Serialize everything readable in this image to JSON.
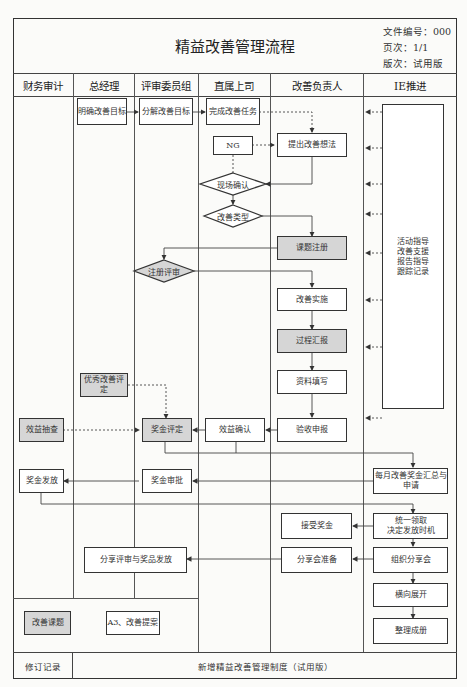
{
  "title": "精益改善管理流程",
  "meta": {
    "doc_no": "文件编号：000",
    "page": "页次：1/1",
    "version": "版次：试用版"
  },
  "columns": [
    "财务审计",
    "总经理",
    "评审委员组",
    "直属上司",
    "改善负责人",
    "IE推进"
  ],
  "nodes": {
    "define_goal": "明确改善目标",
    "decompose_goal": "分解改善目标",
    "complete_task": "完成改善任务",
    "ng": "NG",
    "propose_idea": "提出改善想法",
    "onsite_confirm": "现场确认",
    "improve_type": "改善类型",
    "topic_register": "课题注册",
    "register_review": "注册评审",
    "implement": "改善实施",
    "process_report": "过程汇报",
    "fill_data": "资料填写",
    "acceptance": "验收申报",
    "benefit_confirm": "效益确认",
    "bonus_assess": "奖金评定",
    "excellent_assess": "优秀改善评定",
    "benefit_audit": "效益抽查",
    "ie_support": [
      "活动指导",
      "改善支援",
      "报告指导",
      "跟踪记录"
    ],
    "monthly_summary": "每月改善奖金汇总与申请",
    "bonus_approve": "奖金审批",
    "bonus_pay": "奖金发放",
    "unified_collect": "统一领取\n决定发放时机",
    "accept_bonus": "接受奖金",
    "share_prepare": "分享会准备",
    "organize_share": "组织分享会",
    "share_review": "分享评审与奖品发放",
    "horizontal_expand": "横向展开",
    "compile_book": "整理成册"
  },
  "legend": {
    "grey_item": "改善课题",
    "white_item": "A3、改善提案"
  },
  "footer": {
    "label": "修订记录",
    "content": "新增精益改善管理制度（试用版）"
  },
  "colors": {
    "line": "#333333",
    "grey_fill": "#d6d6d6",
    "background": "#fbfbf9"
  }
}
